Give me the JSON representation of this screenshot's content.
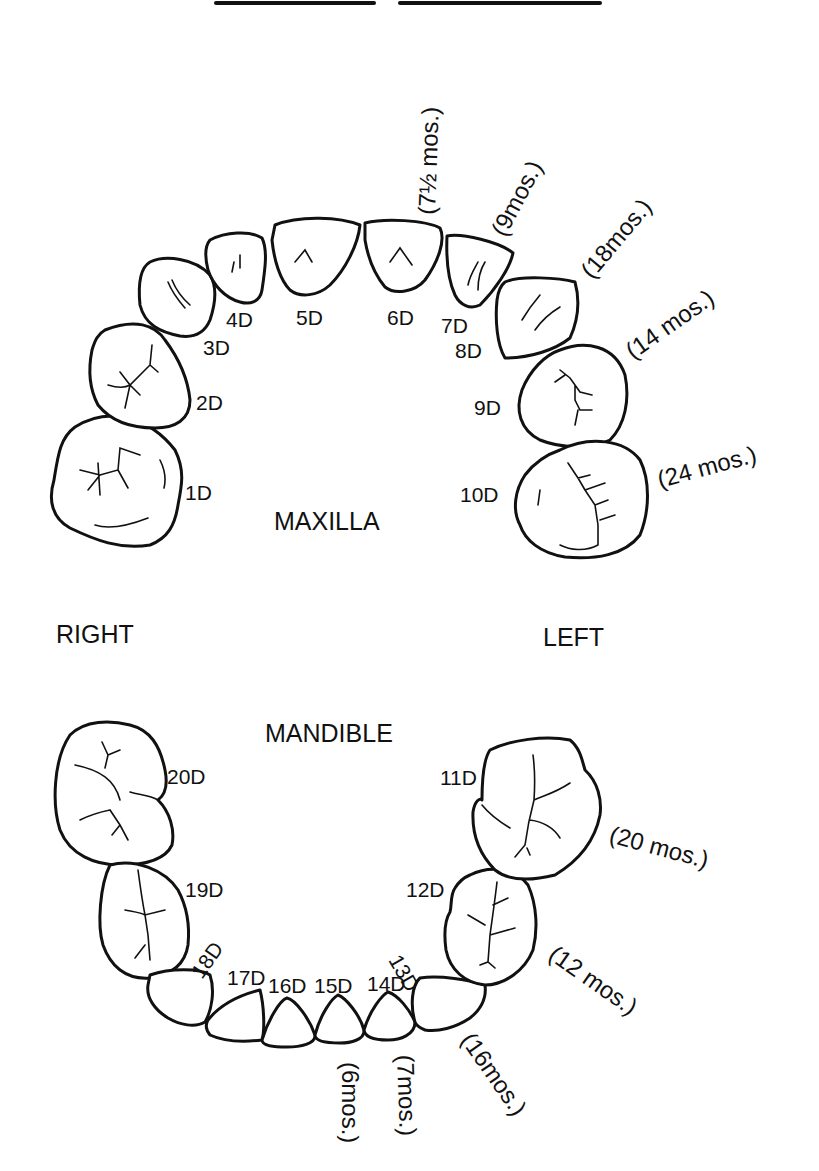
{
  "header": {
    "title_lines": [
      "",
      ""
    ]
  },
  "labels": {
    "maxilla": "MAXILLA",
    "mandible": "MANDIBLE",
    "right": "RIGHT",
    "left": "LEFT"
  },
  "maxilla": {
    "teeth": [
      {
        "id": "1D",
        "label": "1D",
        "age": ""
      },
      {
        "id": "2D",
        "label": "2D",
        "age": ""
      },
      {
        "id": "3D",
        "label": "3D",
        "age": ""
      },
      {
        "id": "4D",
        "label": "4D",
        "age": ""
      },
      {
        "id": "5D",
        "label": "5D",
        "age": ""
      },
      {
        "id": "6D",
        "label": "6D",
        "age": "(7½ mos.)"
      },
      {
        "id": "7D",
        "label": "7D",
        "age": "(9mos.)"
      },
      {
        "id": "8D",
        "label": "8D",
        "age": "(18mos.)"
      },
      {
        "id": "9D",
        "label": "9D",
        "age": "(14 mos.)"
      },
      {
        "id": "10D",
        "label": "10D",
        "age": "(24 mos.)"
      }
    ]
  },
  "mandible": {
    "teeth": [
      {
        "id": "11D",
        "label": "11D",
        "age": "(20 mos.)"
      },
      {
        "id": "12D",
        "label": "12D",
        "age": "(12 mos.)"
      },
      {
        "id": "13D",
        "label": "13D",
        "age": "(16mos.)"
      },
      {
        "id": "14D",
        "label": "14D",
        "age": "(7mos.)"
      },
      {
        "id": "15D",
        "label": "15D",
        "age": "(6mos.)"
      },
      {
        "id": "16D",
        "label": "16D",
        "age": ""
      },
      {
        "id": "17D",
        "label": "17D",
        "age": ""
      },
      {
        "id": "18D",
        "label": "18D",
        "age": ""
      },
      {
        "id": "19D",
        "label": "19D",
        "age": ""
      },
      {
        "id": "20D",
        "label": "20D",
        "age": ""
      }
    ]
  }
}
